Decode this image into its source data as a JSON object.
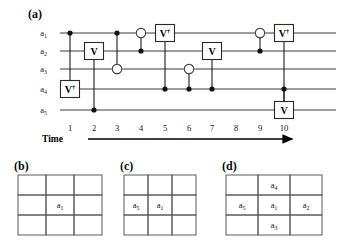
{
  "figure": {
    "panels": [
      {
        "id": "a",
        "label": "(a)",
        "x": 28,
        "y": 8
      },
      {
        "id": "b",
        "label": "(b)",
        "x": 14,
        "y": 160
      },
      {
        "id": "c",
        "label": "(c)",
        "x": 120,
        "y": 160
      },
      {
        "id": "d",
        "label": "(d)",
        "x": 222,
        "y": 160
      }
    ]
  },
  "circuit": {
    "wires": [
      {
        "id": "a1",
        "label": "a",
        "sub": "1",
        "y": 33
      },
      {
        "id": "a2",
        "label": "a",
        "sub": "2",
        "y": 51
      },
      {
        "id": "a3",
        "label": "a",
        "sub": "3",
        "y": 69
      },
      {
        "id": "a4",
        "label": "a",
        "sub": "4",
        "y": 89
      },
      {
        "id": "a5",
        "label": "a",
        "sub": "5",
        "y": 110
      }
    ],
    "wire_x_start": 60,
    "wire_x_end": 336,
    "label_x": 47,
    "time_steps": [
      {
        "step": 1,
        "x": 70
      },
      {
        "step": 2,
        "x": 94
      },
      {
        "step": 3,
        "x": 117
      },
      {
        "step": 4,
        "x": 141
      },
      {
        "step": 5,
        "x": 165
      },
      {
        "step": 6,
        "x": 189
      },
      {
        "step": 7,
        "x": 212
      },
      {
        "step": 8,
        "x": 236
      },
      {
        "step": 9,
        "x": 260
      },
      {
        "step": 10,
        "x": 284
      }
    ],
    "operations": [
      {
        "time": 1,
        "type": "controlled-gate",
        "gate": "Vdag",
        "gate_label": "V",
        "dagger": true,
        "control_wire": "a1",
        "target_wire": "a4"
      },
      {
        "time": 2,
        "type": "controlled-gate",
        "gate": "V",
        "gate_label": "V",
        "dagger": false,
        "control_wire": "a5",
        "target_wire": "a2"
      },
      {
        "time": 3,
        "type": "cnot",
        "gate_label": "CNOT",
        "control_wire": "a1",
        "target_wire": "a3"
      },
      {
        "time": 4,
        "type": "cnot",
        "gate_label": "CNOT",
        "control_wire": "a2",
        "target_wire": "a1"
      },
      {
        "time": 5,
        "type": "controlled-gate",
        "gate": "Vdag",
        "gate_label": "V",
        "dagger": true,
        "control_wire": "a4",
        "target_wire": "a1"
      },
      {
        "time": 6,
        "type": "cnot",
        "gate_label": "CNOT",
        "control_wire": "a4",
        "target_wire": "a3"
      },
      {
        "time": 7,
        "type": "controlled-gate",
        "gate": "V",
        "gate_label": "V",
        "dagger": false,
        "control_wire": "a4",
        "target_wire": "a2"
      },
      {
        "time": 9,
        "type": "cnot",
        "gate_label": "CNOT",
        "control_wire": "a2",
        "target_wire": "a1"
      },
      {
        "time": 10,
        "type": "controlled-gate",
        "gate": "Vdag",
        "gate_label": "V",
        "dagger": true,
        "control_wire": "a5",
        "target_wire": "a1"
      },
      {
        "time": 10,
        "type": "controlled-gate",
        "gate": "V",
        "gate_label": "V",
        "dagger": false,
        "control_wire": "a4",
        "target_wire": "a5"
      }
    ],
    "gate_labels": {
      "v": "V",
      "v_dagger_base": "V",
      "dagger_symbol": "†"
    },
    "axis": {
      "label": "Time",
      "label_x": 42,
      "label_y": 142,
      "ticks": [
        "1",
        "2",
        "3",
        "4",
        "5",
        "6",
        "7",
        "8",
        "9",
        "10"
      ],
      "tick_y": 131,
      "arrow_y": 139,
      "arrow_x_start": 88,
      "arrow_x_end": 292
    }
  },
  "tables": {
    "b": {
      "label": "(b)",
      "x": 18,
      "y": 175,
      "cell_w": 28,
      "cell_h": 20,
      "rows": 3,
      "cols": 3,
      "cells": [
        [
          "",
          "",
          ""
        ],
        [
          "",
          "a1",
          ""
        ],
        [
          "",
          "",
          ""
        ]
      ]
    },
    "c": {
      "label": "(c)",
      "x": 124,
      "y": 175,
      "cell_w": 24,
      "cell_h": 20,
      "rows": 3,
      "cols": 3,
      "cells": [
        [
          "",
          "",
          ""
        ],
        [
          "a5",
          "a1",
          ""
        ],
        [
          "",
          "",
          ""
        ]
      ]
    },
    "d": {
      "label": "(d)",
      "x": 226,
      "y": 175,
      "cell_w": 32,
      "cell_h": 20,
      "rows": 3,
      "cols": 3,
      "cells": [
        [
          "",
          "a4",
          ""
        ],
        [
          "a5",
          "a1",
          "a2"
        ],
        [
          "",
          "a3",
          ""
        ]
      ]
    },
    "cell_tokens": {
      "a1": {
        "base": "a",
        "sub": "1"
      },
      "a2": {
        "base": "a",
        "sub": "2"
      },
      "a3": {
        "base": "a",
        "sub": "3"
      },
      "a4": {
        "base": "a",
        "sub": "4"
      },
      "a5": {
        "base": "a",
        "sub": "5"
      }
    }
  },
  "colors": {
    "ink": "#111111",
    "wire": "#3a3a3a",
    "grid": "#5a5a5a",
    "background": "#ffffff"
  }
}
